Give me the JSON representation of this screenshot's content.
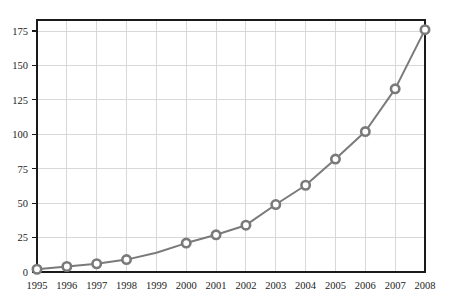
{
  "chart_data": {
    "type": "line",
    "title": "",
    "subtitle": "",
    "xlabel": "",
    "ylabel": "",
    "x": [
      1995,
      1996,
      1997,
      1998,
      1999,
      2000,
      2001,
      2002,
      2003,
      2004,
      2005,
      2006,
      2007,
      2008
    ],
    "categories": [
      "1995",
      "1996",
      "1997",
      "1998",
      "1999",
      "2000",
      "2001",
      "2002",
      "2003",
      "2004",
      "2005",
      "2006",
      "2007",
      "2008"
    ],
    "values": [
      2,
      4,
      6,
      9,
      14,
      21,
      27,
      34,
      49,
      63,
      82,
      102,
      133,
      176
    ],
    "markers_shown_at": [
      "1995",
      "1996",
      "1997",
      "1998",
      "2000",
      "2001",
      "2002",
      "2003",
      "2004",
      "2005",
      "2006",
      "2007",
      "2008"
    ],
    "xtick_labels": [
      "1995",
      "1996",
      "1997",
      "1998",
      "1999",
      "2000",
      "2001",
      "2002",
      "2003",
      "2004",
      "2005",
      "2006",
      "2007",
      "2008"
    ],
    "ytick_labels": [
      "0",
      "25",
      "50",
      "75",
      "100",
      "125",
      "150",
      "175"
    ],
    "ytick_values": [
      0,
      25,
      50,
      75,
      100,
      125,
      150,
      175
    ],
    "ylim": [
      0,
      183
    ],
    "xlim": [
      1995,
      2008
    ],
    "grid": true,
    "legend": false,
    "legend_position": "none",
    "series": [
      {
        "name": "series-1",
        "values": [
          2,
          4,
          6,
          9,
          14,
          21,
          27,
          34,
          49,
          63,
          82,
          102,
          133,
          176
        ]
      }
    ],
    "colors": {
      "line": "#7a7a7a",
      "marker_fill": "#ffffff",
      "marker_stroke": "#7a7a7a",
      "grid": "#d8d8d8",
      "axis_border": "#1a1a1a",
      "background": "#ffffff",
      "tick_text": "#1b1b1b"
    }
  }
}
